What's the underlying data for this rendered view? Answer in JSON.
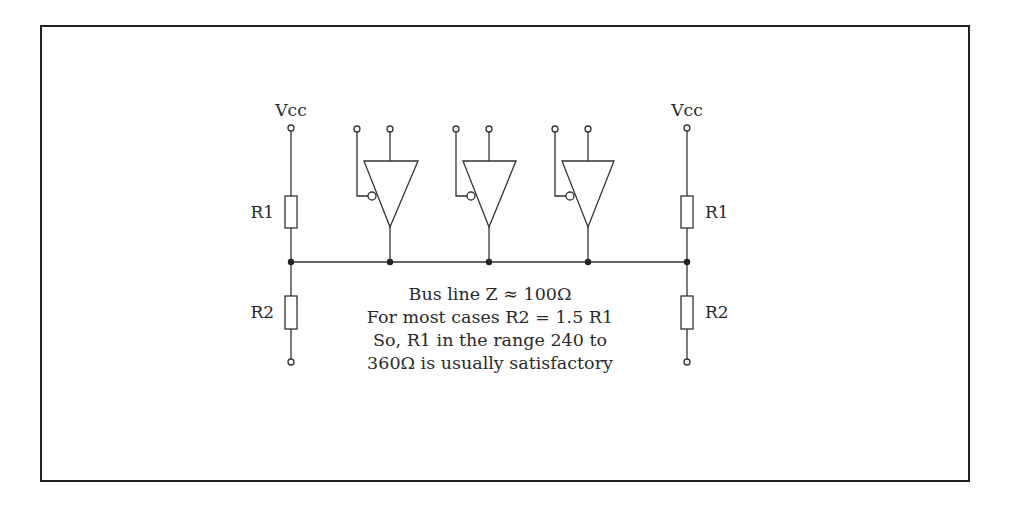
{
  "diagram": {
    "colors": {
      "stroke": "#333333",
      "frame": "#222222",
      "background": "#ffffff"
    },
    "left_network": {
      "supply_label": "Vcc",
      "upper_resistor_label": "R1",
      "lower_resistor_label": "R2"
    },
    "right_network": {
      "supply_label": "Vcc",
      "upper_resistor_label": "R1",
      "lower_resistor_label": "R2"
    },
    "drivers": [
      {
        "name": "driver-1",
        "type": "tri-state buffer",
        "enable": "active-low"
      },
      {
        "name": "driver-2",
        "type": "tri-state buffer",
        "enable": "active-low"
      },
      {
        "name": "driver-3",
        "type": "tri-state buffer",
        "enable": "active-low"
      }
    ],
    "notes": [
      "Bus line Z ≈ 100Ω",
      "For most cases R2 = 1.5 R1",
      "So, R1 in the range 240 to",
      "360Ω is usually satisfactory"
    ]
  }
}
